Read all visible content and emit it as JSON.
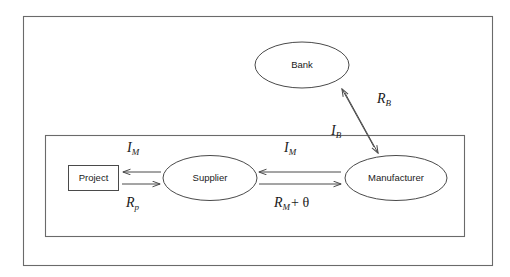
{
  "diagram": {
    "nodes": [
      {
        "id": "bank",
        "label": "Bank",
        "shape": "ellipse"
      },
      {
        "id": "project",
        "label": "Project",
        "shape": "rectangle"
      },
      {
        "id": "supplier",
        "label": "Supplier",
        "shape": "ellipse"
      },
      {
        "id": "manufacturer",
        "label": "Manufacturer",
        "shape": "ellipse"
      }
    ],
    "edge_labels": [
      {
        "id": "i-m-project",
        "base": "I",
        "sub": "M",
        "extra": ""
      },
      {
        "id": "r-p",
        "base": "R",
        "sub": "p",
        "extra": ""
      },
      {
        "id": "i-m-supplier",
        "base": "I",
        "sub": "M",
        "extra": ""
      },
      {
        "id": "r-m-theta",
        "base": "R",
        "sub": "M",
        "extra": "+ θ"
      },
      {
        "id": "i-b",
        "base": "I",
        "sub": "B",
        "extra": ""
      },
      {
        "id": "r-b",
        "base": "R",
        "sub": "B",
        "extra": ""
      }
    ],
    "containers": [
      {
        "id": "outer-frame",
        "label": ""
      },
      {
        "id": "inner-frame",
        "label": ""
      }
    ],
    "colors": {
      "stroke": "#4a4a4a",
      "frame": "#6a6a6a",
      "text": "#1a1a1a",
      "background": "#ffffff"
    }
  }
}
